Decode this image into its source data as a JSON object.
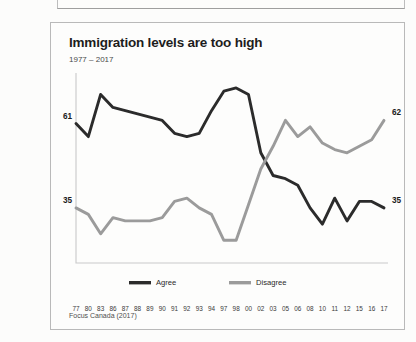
{
  "figure": {
    "title": "Immigration levels are too high",
    "subtitle": "1977 – 2017",
    "source": "Focus Canada (2017)"
  },
  "chart_data": {
    "type": "line",
    "title": "Immigration levels are too high",
    "subtitle": "1977 – 2017",
    "xlabel": "",
    "ylabel": "",
    "ylim": [
      18,
      76
    ],
    "grid": false,
    "legend_position": "center-bottom",
    "source": "Focus Canada (2017)",
    "categories": [
      "77",
      "80",
      "83",
      "86",
      "87",
      "88",
      "89",
      "90",
      "91",
      "92",
      "93",
      "94",
      "97",
      "98",
      "00",
      "02",
      "03",
      "05",
      "06",
      "08",
      "10",
      "11",
      "12",
      "15",
      "16",
      "17"
    ],
    "series": [
      {
        "name": "Agree",
        "color": "#2b2b2b",
        "values": [
          61,
          57,
          70,
          66,
          65,
          64,
          63,
          62,
          58,
          57,
          58,
          65,
          71,
          72,
          70,
          52,
          45,
          44,
          42,
          35,
          30,
          38,
          31,
          37,
          37,
          35
        ],
        "start_label": "61",
        "end_label": "62"
      },
      {
        "name": "Disagree",
        "color": "#9b9b9b",
        "values": [
          35,
          33,
          27,
          32,
          31,
          31,
          31,
          32,
          37,
          38,
          35,
          33,
          25,
          25,
          36,
          47,
          54,
          62,
          57,
          60,
          55,
          53,
          52,
          54,
          56,
          62
        ],
        "start_label": "35",
        "end_label": "35"
      }
    ],
    "endpoint_labels": {
      "left_top": "61",
      "left_bottom": "35",
      "right_top": "62",
      "right_bottom": "35"
    },
    "legend": [
      {
        "label": "Agree",
        "color": "#2b2b2b"
      },
      {
        "label": "Disagree",
        "color": "#9b9b9b"
      }
    ]
  }
}
